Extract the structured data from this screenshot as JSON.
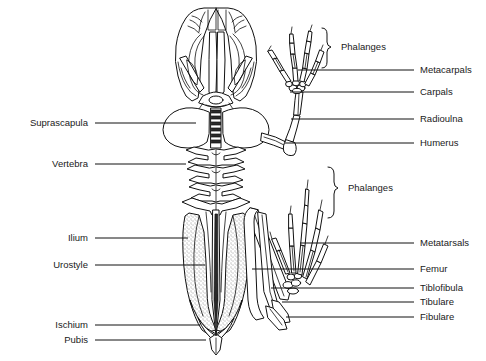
{
  "diagram": {
    "background_color": "#ffffff",
    "line_color": "#111111",
    "text_color": "#1a1a1a"
  },
  "labels_left": [
    {
      "id": "suprascapula",
      "text": "Suprascapula",
      "text_x": 88,
      "text_y": 126,
      "line_x1": 95,
      "line_y1": 123,
      "line_x2": 196,
      "line_y2": 123
    },
    {
      "id": "vertebra",
      "text": "Vertebra",
      "text_x": 88,
      "text_y": 167,
      "line_x1": 95,
      "line_y1": 164,
      "line_x2": 186,
      "line_y2": 164
    },
    {
      "id": "ilium",
      "text": "Ilium",
      "text_x": 88,
      "text_y": 241,
      "line_x1": 95,
      "line_y1": 238,
      "line_x2": 188,
      "line_y2": 238
    },
    {
      "id": "urostyle",
      "text": "Urostyle",
      "text_x": 88,
      "text_y": 268,
      "line_x1": 95,
      "line_y1": 265,
      "line_x2": 205,
      "line_y2": 265
    },
    {
      "id": "ischium",
      "text": "Ischium",
      "text_x": 88,
      "text_y": 328,
      "line_x1": 95,
      "line_y1": 325,
      "line_x2": 200,
      "line_y2": 325
    },
    {
      "id": "pubis",
      "text": "Pubis",
      "text_x": 88,
      "text_y": 343,
      "line_x1": 95,
      "line_y1": 340,
      "line_x2": 206,
      "line_y2": 340
    }
  ],
  "labels_right": [
    {
      "id": "metacarpals",
      "text": "Metacarpals",
      "text_x": 420,
      "text_y": 73,
      "line_x1": 414,
      "line_y1": 70,
      "line_x2": 298,
      "line_y2": 70
    },
    {
      "id": "carpals",
      "text": "Carpals",
      "text_x": 420,
      "text_y": 95,
      "line_x1": 414,
      "line_y1": 92,
      "line_x2": 290,
      "line_y2": 92
    },
    {
      "id": "radioulna",
      "text": "Radioulna",
      "text_x": 420,
      "text_y": 122,
      "line_x1": 414,
      "line_y1": 119,
      "line_x2": 291,
      "line_y2": 119
    },
    {
      "id": "humerus",
      "text": "Humerus",
      "text_x": 420,
      "text_y": 146,
      "line_x1": 414,
      "line_y1": 143,
      "line_x2": 285,
      "line_y2": 143
    },
    {
      "id": "metatarsals",
      "text": "Metatarsals",
      "text_x": 420,
      "text_y": 246,
      "line_x1": 414,
      "line_y1": 243,
      "line_x2": 300,
      "line_y2": 243
    },
    {
      "id": "femur",
      "text": "Femur",
      "text_x": 420,
      "text_y": 272,
      "line_x1": 414,
      "line_y1": 269,
      "line_x2": 252,
      "line_y2": 269
    },
    {
      "id": "tiblofibula",
      "text": "Tiblofibula",
      "text_x": 420,
      "text_y": 291,
      "line_x1": 414,
      "line_y1": 288,
      "line_x2": 271,
      "line_y2": 288
    },
    {
      "id": "tibulare",
      "text": "Tibulare",
      "text_x": 420,
      "text_y": 305,
      "line_x1": 414,
      "line_y1": 302,
      "line_x2": 282,
      "line_y2": 302
    },
    {
      "id": "fibulare",
      "text": "Fibulare",
      "text_x": 420,
      "text_y": 320,
      "line_x1": 414,
      "line_y1": 317,
      "line_x2": 286,
      "line_y2": 317
    }
  ],
  "brackets": [
    {
      "id": "phalanges-fore",
      "text": "Phalanges",
      "text_x": 341,
      "text_y": 50,
      "path": "M 322 28 Q 327 28 327 34 L 327 42 Q 327 46 331 47 Q 327 48 327 52 L 327 62 Q 327 68 322 68",
      "region": "forelimb"
    },
    {
      "id": "phalanges-hind",
      "text": "Phalanges",
      "text_x": 348,
      "text_y": 191,
      "path": "M 328 167 Q 334 167 334 174 L 334 182 Q 334 187 338 188 Q 334 189 334 194 L 334 211 Q 334 218 328 218",
      "region": "hindlimb"
    }
  ],
  "skeleton_parts": [
    {
      "id": "skull",
      "name": "skull"
    },
    {
      "id": "suprascapula-left",
      "name": "suprascapula-left"
    },
    {
      "id": "suprascapula-right",
      "name": "suprascapula-right"
    },
    {
      "id": "vertebral-column",
      "name": "vertebral-column"
    },
    {
      "id": "pelvis",
      "name": "pelvis"
    },
    {
      "id": "urostyle-bone",
      "name": "urostyle-bone"
    },
    {
      "id": "forelimb",
      "name": "forelimb-right"
    },
    {
      "id": "hindlimb",
      "name": "hindlimb-right"
    }
  ]
}
